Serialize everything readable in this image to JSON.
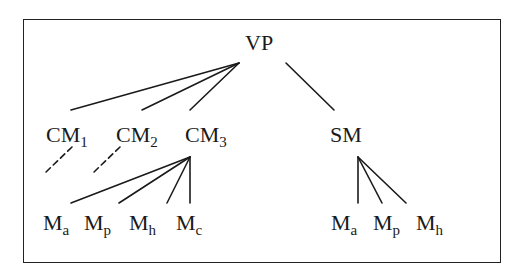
{
  "diagram": {
    "type": "tree",
    "colors": {
      "stroke": "#1a1a1a",
      "text": "#1a1a1a",
      "background": "#ffffff",
      "frame": "#222222"
    },
    "root": {
      "id": "vp",
      "label": "VP"
    },
    "nodes": [
      {
        "id": "vp",
        "base": "VP",
        "sub": ""
      },
      {
        "id": "cm1",
        "base": "CM",
        "sub": "1"
      },
      {
        "id": "cm2",
        "base": "CM",
        "sub": "2"
      },
      {
        "id": "cm3",
        "base": "CM",
        "sub": "3"
      },
      {
        "id": "sm",
        "base": "SM",
        "sub": ""
      },
      {
        "id": "cm3_ma",
        "base": "M",
        "sub": "a"
      },
      {
        "id": "cm3_mp",
        "base": "M",
        "sub": "p"
      },
      {
        "id": "cm3_mh",
        "base": "M",
        "sub": "h"
      },
      {
        "id": "cm3_mc",
        "base": "M",
        "sub": "c"
      },
      {
        "id": "sm_ma",
        "base": "M",
        "sub": "a"
      },
      {
        "id": "sm_mp",
        "base": "M",
        "sub": "p"
      },
      {
        "id": "sm_mh",
        "base": "M",
        "sub": "h"
      }
    ],
    "edges": [
      {
        "from": "vp",
        "to": "cm1",
        "style": "solid"
      },
      {
        "from": "vp",
        "to": "cm2",
        "style": "solid"
      },
      {
        "from": "vp",
        "to": "cm3",
        "style": "solid"
      },
      {
        "from": "vp",
        "to": "sm",
        "style": "solid"
      },
      {
        "from": "cm1",
        "to": "(elided)",
        "style": "dashed"
      },
      {
        "from": "cm2",
        "to": "(elided)",
        "style": "dashed"
      },
      {
        "from": "cm3",
        "to": "cm3_ma",
        "style": "solid"
      },
      {
        "from": "cm3",
        "to": "cm3_mp",
        "style": "solid"
      },
      {
        "from": "cm3",
        "to": "cm3_mh",
        "style": "solid"
      },
      {
        "from": "cm3",
        "to": "cm3_mc",
        "style": "solid"
      },
      {
        "from": "sm",
        "to": "sm_ma",
        "style": "solid"
      },
      {
        "from": "sm",
        "to": "sm_mp",
        "style": "solid"
      },
      {
        "from": "sm",
        "to": "sm_mh",
        "style": "solid"
      }
    ]
  },
  "labels": {
    "vp": {
      "base": "VP",
      "sub": ""
    },
    "cm1": {
      "base": "CM",
      "sub": "1"
    },
    "cm2": {
      "base": "CM",
      "sub": "2"
    },
    "cm3": {
      "base": "CM",
      "sub": "3"
    },
    "sm": {
      "base": "SM",
      "sub": ""
    },
    "cm3_ma": {
      "base": "M",
      "sub": "a"
    },
    "cm3_mp": {
      "base": "M",
      "sub": "p"
    },
    "cm3_mh": {
      "base": "M",
      "sub": "h"
    },
    "cm3_mc": {
      "base": "M",
      "sub": "c"
    },
    "sm_ma": {
      "base": "M",
      "sub": "a"
    },
    "sm_mp": {
      "base": "M",
      "sub": "p"
    },
    "sm_mh": {
      "base": "M",
      "sub": "h"
    }
  }
}
